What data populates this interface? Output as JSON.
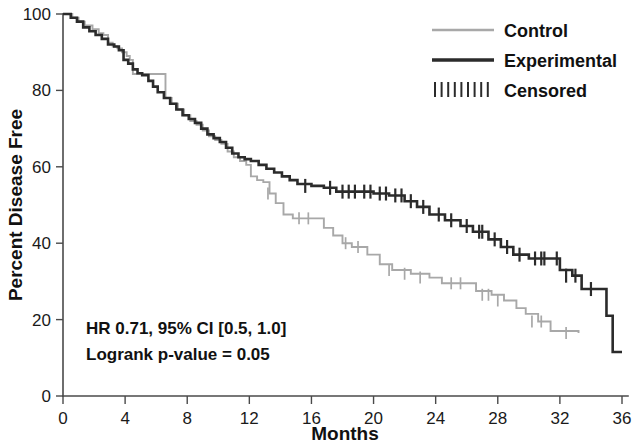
{
  "chart_data": {
    "type": "line",
    "title": "",
    "xlabel": "Months",
    "ylabel": "Percent Disease Free",
    "xlim": [
      0,
      36
    ],
    "ylim": [
      0,
      100
    ],
    "xticks": [
      0,
      4,
      8,
      12,
      16,
      20,
      24,
      28,
      32,
      36
    ],
    "xtick_labels": [
      "0",
      "4",
      "8",
      "12",
      "16",
      "20",
      "24",
      "28",
      "32",
      "36"
    ],
    "yticks": [
      0,
      20,
      40,
      60,
      80,
      100
    ],
    "ytick_labels": [
      "0",
      "20",
      "40",
      "60",
      "80",
      "100"
    ],
    "grid": false,
    "legend_position": "top-right",
    "plot_style": "kaplan-meier-step",
    "series": [
      {
        "name": "Control",
        "color": "#a8a8a8",
        "style": "step",
        "points": [
          [
            0.0,
            100.0
          ],
          [
            0.6,
            99.0
          ],
          [
            1.0,
            98.0
          ],
          [
            1.4,
            97.0
          ],
          [
            1.9,
            96.0
          ],
          [
            2.3,
            95.0
          ],
          [
            2.6,
            94.5
          ],
          [
            2.9,
            92.5
          ],
          [
            3.2,
            91.5
          ],
          [
            3.5,
            91.0
          ],
          [
            3.8,
            90.0
          ],
          [
            4.1,
            89.0
          ],
          [
            4.3,
            88.0
          ],
          [
            4.5,
            84.3
          ],
          [
            6.4,
            84.3
          ],
          [
            6.6,
            78.0
          ],
          [
            7.0,
            76.5
          ],
          [
            7.4,
            75.0
          ],
          [
            7.8,
            73.5
          ],
          [
            8.2,
            72.0
          ],
          [
            8.6,
            71.0
          ],
          [
            9.0,
            69.5
          ],
          [
            9.4,
            68.0
          ],
          [
            9.8,
            67.0
          ],
          [
            10.2,
            66.0
          ],
          [
            10.6,
            64.0
          ],
          [
            11.0,
            62.5
          ],
          [
            11.4,
            61.5
          ],
          [
            11.8,
            60.5
          ],
          [
            12.1,
            57.5
          ],
          [
            12.5,
            56.5
          ],
          [
            12.9,
            56.0
          ],
          [
            13.3,
            53.0
          ],
          [
            13.7,
            50.5
          ],
          [
            14.2,
            47.5
          ],
          [
            14.8,
            46.5
          ],
          [
            16.4,
            46.5
          ],
          [
            16.8,
            44.0
          ],
          [
            17.4,
            42.0
          ],
          [
            18.0,
            40.0
          ],
          [
            18.6,
            39.0
          ],
          [
            19.6,
            37.0
          ],
          [
            20.4,
            34.5
          ],
          [
            21.2,
            33.0
          ],
          [
            22.4,
            32.0
          ],
          [
            23.6,
            31.0
          ],
          [
            24.4,
            29.5
          ],
          [
            26.0,
            29.5
          ],
          [
            26.6,
            27.5
          ],
          [
            27.6,
            26.5
          ],
          [
            28.4,
            25.0
          ],
          [
            29.2,
            23.0
          ],
          [
            29.8,
            21.5
          ],
          [
            30.6,
            19.5
          ],
          [
            31.4,
            17.0
          ],
          [
            33.2,
            16.5
          ]
        ],
        "censored": [
          [
            13.2,
            53.0
          ],
          [
            15.2,
            46.5
          ],
          [
            15.8,
            46.5
          ],
          [
            18.2,
            40.0
          ],
          [
            19.0,
            39.0
          ],
          [
            21.0,
            33.0
          ],
          [
            22.0,
            32.0
          ],
          [
            23.0,
            31.0
          ],
          [
            25.0,
            29.5
          ],
          [
            25.6,
            29.5
          ],
          [
            27.0,
            26.5
          ],
          [
            27.4,
            26.5
          ],
          [
            28.0,
            25.0
          ],
          [
            30.2,
            19.5
          ],
          [
            30.8,
            19.5
          ],
          [
            32.4,
            16.5
          ]
        ]
      },
      {
        "name": "Experimental",
        "color": "#2b2b2b",
        "style": "step",
        "points": [
          [
            0.0,
            100.0
          ],
          [
            0.5,
            99.0
          ],
          [
            0.9,
            98.0
          ],
          [
            1.3,
            96.5
          ],
          [
            1.7,
            95.5
          ],
          [
            2.1,
            94.5
          ],
          [
            2.5,
            93.5
          ],
          [
            2.9,
            92.0
          ],
          [
            3.3,
            91.5
          ],
          [
            3.6,
            90.5
          ],
          [
            3.9,
            88.0
          ],
          [
            4.2,
            87.0
          ],
          [
            4.5,
            85.5
          ],
          [
            4.8,
            84.5
          ],
          [
            5.1,
            84.0
          ],
          [
            5.5,
            82.5
          ],
          [
            5.8,
            81.0
          ],
          [
            6.1,
            79.5
          ],
          [
            6.5,
            78.0
          ],
          [
            6.9,
            76.5
          ],
          [
            7.3,
            75.0
          ],
          [
            7.7,
            73.5
          ],
          [
            8.1,
            72.5
          ],
          [
            8.5,
            71.5
          ],
          [
            8.9,
            70.0
          ],
          [
            9.3,
            68.5
          ],
          [
            9.7,
            67.5
          ],
          [
            10.1,
            66.5
          ],
          [
            10.5,
            65.0
          ],
          [
            10.9,
            63.5
          ],
          [
            11.3,
            62.5
          ],
          [
            11.7,
            62.0
          ],
          [
            12.1,
            61.5
          ],
          [
            12.6,
            60.5
          ],
          [
            13.1,
            59.5
          ],
          [
            13.6,
            58.5
          ],
          [
            14.1,
            57.5
          ],
          [
            14.6,
            56.5
          ],
          [
            15.1,
            55.5
          ],
          [
            16.0,
            55.0
          ],
          [
            16.8,
            54.5
          ],
          [
            17.6,
            53.5
          ],
          [
            19.2,
            53.5
          ],
          [
            20.0,
            53.0
          ],
          [
            21.0,
            52.5
          ],
          [
            22.0,
            51.0
          ],
          [
            22.8,
            49.5
          ],
          [
            23.6,
            47.5
          ],
          [
            24.6,
            46.0
          ],
          [
            25.6,
            44.5
          ],
          [
            26.4,
            43.0
          ],
          [
            27.4,
            41.0
          ],
          [
            28.2,
            39.0
          ],
          [
            29.0,
            37.0
          ],
          [
            30.0,
            36.0
          ],
          [
            31.4,
            36.0
          ],
          [
            32.0,
            33.0
          ],
          [
            32.8,
            31.5
          ],
          [
            33.4,
            28.0
          ],
          [
            34.6,
            28.0
          ],
          [
            35.0,
            21.0
          ],
          [
            35.4,
            11.5
          ],
          [
            36.0,
            11.5
          ]
        ],
        "censored": [
          [
            15.6,
            55.0
          ],
          [
            17.2,
            54.5
          ],
          [
            18.0,
            53.5
          ],
          [
            18.4,
            53.5
          ],
          [
            18.8,
            53.5
          ],
          [
            19.4,
            53.5
          ],
          [
            19.8,
            53.5
          ],
          [
            20.4,
            53.0
          ],
          [
            20.8,
            53.0
          ],
          [
            21.4,
            52.5
          ],
          [
            21.8,
            52.5
          ],
          [
            22.4,
            51.0
          ],
          [
            23.2,
            49.5
          ],
          [
            24.2,
            47.5
          ],
          [
            25.0,
            46.0
          ],
          [
            26.0,
            44.5
          ],
          [
            26.8,
            43.0
          ],
          [
            27.0,
            43.0
          ],
          [
            27.8,
            41.0
          ],
          [
            28.6,
            39.0
          ],
          [
            29.4,
            37.0
          ],
          [
            30.4,
            36.0
          ],
          [
            30.8,
            36.0
          ],
          [
            31.0,
            36.0
          ],
          [
            31.8,
            36.0
          ],
          [
            32.4,
            31.5
          ],
          [
            33.0,
            31.5
          ],
          [
            34.0,
            28.0
          ]
        ]
      }
    ],
    "annotations": [
      "HR 0.71, 95% CI [0.5, 1.0]",
      "Logrank p-value = 0.05"
    ]
  },
  "legend": {
    "items": [
      {
        "label": "Control",
        "swatch": "line",
        "color": "#a8a8a8"
      },
      {
        "label": "Experimental",
        "swatch": "line",
        "color": "#2b2b2b"
      },
      {
        "label": "Censored",
        "swatch": "ticks",
        "color": "#2b2b2b"
      }
    ]
  },
  "axes": {
    "x_title": "Months",
    "y_title": "Percent Disease Free"
  },
  "stats": {
    "line1": "HR 0.71, 95% CI [0.5, 1.0]",
    "line2": "Logrank p-value = 0.05"
  }
}
